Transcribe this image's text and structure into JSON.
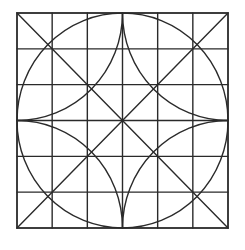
{
  "figure": {
    "grid_divisions": 6,
    "elements": [
      "outer-square",
      "grid-lines",
      "diagonals",
      "inscribed-circle",
      "corner-arcs"
    ],
    "stroke_color": "#2a2a2a",
    "background_color": "#ffffff"
  }
}
